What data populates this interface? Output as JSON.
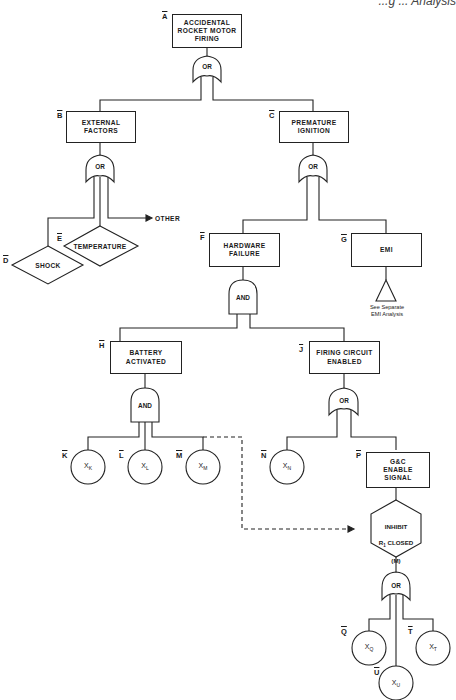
{
  "header": {
    "running_title": "...g ... Analysis"
  },
  "diagram": {
    "events": {
      "A": {
        "label": "A",
        "text": "ACCIDENTAL\nROCKET MOTOR\nFIRING",
        "shape": "rectangle"
      },
      "B": {
        "label": "B",
        "text": "EXTERNAL\nFACTORS",
        "shape": "rectangle"
      },
      "C": {
        "label": "C",
        "text": "PREMATURE\nIGNITION",
        "shape": "rectangle"
      },
      "D": {
        "label": "D",
        "text": "SHOCK",
        "shape": "diamond"
      },
      "E": {
        "label": "E",
        "text": "TEMPERATURE",
        "shape": "diamond"
      },
      "F": {
        "label": "F",
        "text": "HARDWARE\nFAILURE",
        "shape": "rectangle"
      },
      "G": {
        "label": "G",
        "text": "EMI",
        "shape": "rectangle"
      },
      "H": {
        "label": "H",
        "text": "BATTERY\nACTIVATED",
        "shape": "rectangle"
      },
      "J": {
        "label": "J",
        "text": "FIRING CIRCUIT\nENABLED",
        "shape": "rectangle"
      },
      "K": {
        "label": "K",
        "var": "X",
        "sub": "K",
        "shape": "circle"
      },
      "L": {
        "label": "L",
        "var": "X",
        "sub": "L",
        "shape": "circle"
      },
      "M": {
        "label": "M",
        "var": "X",
        "sub": "M",
        "shape": "circle"
      },
      "N": {
        "label": "N",
        "var": "X",
        "sub": "N",
        "shape": "circle"
      },
      "P": {
        "label": "P",
        "text": "G&C\nENABLE\nSIGNAL",
        "shape": "rectangle"
      },
      "Q": {
        "label": "Q",
        "var": "X",
        "sub": "Q",
        "shape": "circle"
      },
      "T": {
        "label": "T",
        "var": "X",
        "sub": "T",
        "shape": "circle"
      },
      "U": {
        "label": "U",
        "var": "X",
        "sub": "U",
        "shape": "circle"
      }
    },
    "gates": {
      "g_A": {
        "type": "OR"
      },
      "g_B": {
        "type": "OR"
      },
      "g_C": {
        "type": "OR"
      },
      "g_F": {
        "type": "AND"
      },
      "g_H": {
        "type": "AND"
      },
      "g_J": {
        "type": "OR"
      },
      "g_inhibit": {
        "type": "OR"
      }
    },
    "inhibit": {
      "line1": "INHIBIT",
      "line2_var": "R",
      "line2_sub": "1",
      "line2_rest": " CLOSED",
      "line3": "(M)"
    },
    "other_label": "OTHER",
    "transfer_note": "See Separate\nEMI Analysis"
  }
}
